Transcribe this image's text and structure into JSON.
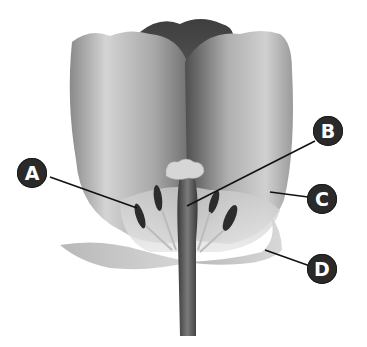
{
  "diagram": {
    "labels": [
      {
        "id": "A",
        "text": "A",
        "points_to": "anther"
      },
      {
        "id": "B",
        "text": "B",
        "points_to": "style/pistil"
      },
      {
        "id": "C",
        "text": "C",
        "points_to": "petal"
      },
      {
        "id": "D",
        "text": "D",
        "points_to": "sepal"
      }
    ]
  },
  "colors": {
    "label_fill": "#2a2a2a",
    "label_text": "#ffffff",
    "leader_line": "#111111",
    "background": "#ffffff"
  }
}
